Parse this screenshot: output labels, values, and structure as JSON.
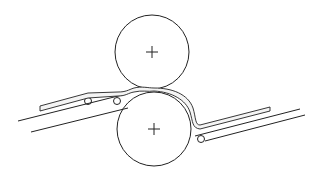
{
  "diagram": {
    "type": "calender-roll-nip",
    "labels": [],
    "colors": {
      "stroke": "#222222",
      "background": "#ffffff",
      "web_fill": "#f4f4f4"
    },
    "rollers": [
      {
        "name": "top-roller",
        "cx": 152,
        "cy": 52,
        "r": 37
      },
      {
        "name": "bottom-roller",
        "cx": 154,
        "cy": 129,
        "r": 37
      }
    ]
  }
}
